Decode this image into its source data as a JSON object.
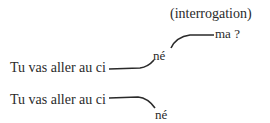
{
  "annotation": "(interrogation)",
  "example_question": {
    "prefix": "Tu vas aller au ci",
    "syllable": "né",
    "ending": "ma ?",
    "intonation": "rising"
  },
  "example_statement": {
    "prefix": "Tu vas aller au ci",
    "syllable": "né",
    "intonation": "falling"
  },
  "colors": {
    "ink": "#2a2a2a",
    "background": "#ffffff"
  }
}
